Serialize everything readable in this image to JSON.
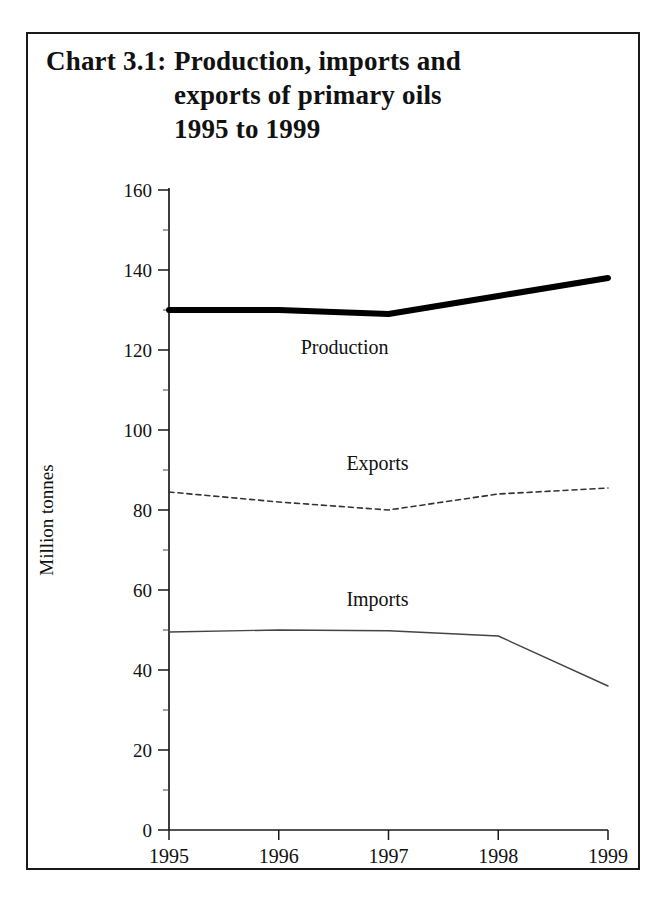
{
  "chart_data": {
    "type": "line",
    "title": "Chart 3.1:   Production, imports and exports of primary oils 1995 to 1999",
    "title_label": "Chart 3.1:",
    "title_lines": [
      "Production, imports and",
      "exports of primary oils",
      "1995 to 1999"
    ],
    "xlabel": "",
    "ylabel": "Million tonnes",
    "x": [
      1995,
      1996,
      1997,
      1998,
      1999
    ],
    "categories": [
      "1995",
      "1996",
      "1997",
      "1998",
      "1999"
    ],
    "ylim": [
      0,
      160
    ],
    "ytick_step": 20,
    "yticks": [
      0,
      20,
      40,
      60,
      80,
      100,
      120,
      140,
      160
    ],
    "ytick_labels": [
      "0",
      "20",
      "40",
      "60",
      "80",
      "100",
      "120",
      "140",
      "160"
    ],
    "minor_tick_step": 10,
    "grid": false,
    "legend": "inline-labels",
    "series": [
      {
        "name": "Production",
        "values": [
          130,
          130,
          129,
          133.5,
          138
        ],
        "style": "solid-thick",
        "color": "#000000",
        "width": 6,
        "label_x": 1996.6,
        "label_y": 119
      },
      {
        "name": "Exports",
        "values": [
          84.5,
          82,
          80,
          84,
          85.5
        ],
        "style": "dashed",
        "color": "#333333",
        "width": 1.6,
        "label_x": 1996.9,
        "label_y": 90
      },
      {
        "name": "Imports",
        "values": [
          49.5,
          50,
          49.8,
          48.5,
          36
        ],
        "style": "solid-thin",
        "color": "#444444",
        "width": 1.4,
        "label_x": 1996.9,
        "label_y": 56
      }
    ]
  }
}
